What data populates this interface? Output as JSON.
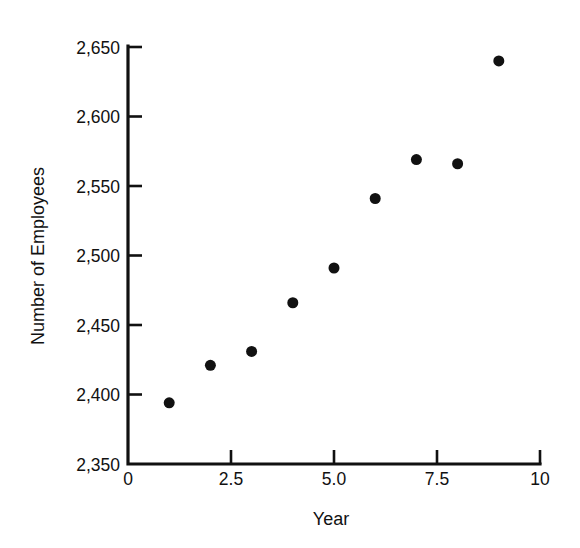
{
  "chart_data": {
    "type": "scatter",
    "title": "",
    "xlabel": "Year",
    "ylabel": "Number of Employees",
    "xlim": [
      0,
      10
    ],
    "ylim": [
      2350,
      2650
    ],
    "xticks": [
      0,
      2.5,
      5.0,
      7.5,
      10
    ],
    "xtick_labels": [
      "0",
      "2.5",
      "5.0",
      "7.5",
      "10"
    ],
    "yticks": [
      2350,
      2400,
      2450,
      2500,
      2550,
      2600,
      2650
    ],
    "ytick_labels": [
      "2,350",
      "2,400",
      "2,450",
      "2,500",
      "2,550",
      "2,600",
      "2,650"
    ],
    "grid": false,
    "legend": false,
    "marker": "filled-circle",
    "marker_color": "#111111",
    "marker_size_px": 11,
    "x": [
      1,
      2,
      3,
      4,
      5,
      6,
      7,
      8,
      9
    ],
    "y": [
      2394,
      2421,
      2431,
      2466,
      2491,
      2541,
      2569,
      2566,
      2640
    ],
    "points": [
      {
        "x": 1,
        "y": 2394
      },
      {
        "x": 2,
        "y": 2421
      },
      {
        "x": 3,
        "y": 2431
      },
      {
        "x": 4,
        "y": 2466
      },
      {
        "x": 5,
        "y": 2491
      },
      {
        "x": 6,
        "y": 2541
      },
      {
        "x": 7,
        "y": 2569
      },
      {
        "x": 8,
        "y": 2566
      },
      {
        "x": 9,
        "y": 2640
      }
    ]
  },
  "colors": {
    "axis": "#111111",
    "marker": "#111111",
    "background": "#ffffff"
  }
}
